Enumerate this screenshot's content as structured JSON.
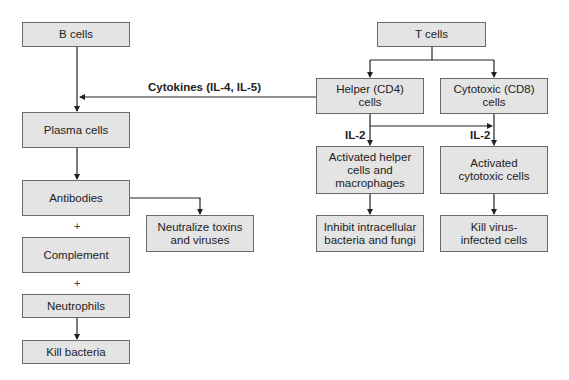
{
  "diagram": {
    "b_branch": {
      "b_cells": "B cells",
      "plasma_cells": "Plasma cells",
      "antibodies": "Antibodies",
      "neutralize": "Neutralize toxins and viruses",
      "plus1": "+",
      "complement": "Complement",
      "plus2": "+",
      "neutrophils": "Neutrophils",
      "kill_bacteria": "Kill bacteria"
    },
    "t_branch": {
      "t_cells": "T cells",
      "helper": "Helper (CD4) cells",
      "cytotoxic": "Cytotoxic (CD8) cells",
      "activated_helper": "Activated helper cells and macrophages",
      "activated_cytotoxic": "Activated cytotoxic cells",
      "inhibit": "Inhibit intracellular bacteria and fungi",
      "kill_virus": "Kill virus-infected cells"
    },
    "edge_labels": {
      "cytokines": "Cytokines (IL-4, IL-5)",
      "il2_left": "IL-2",
      "il2_right": "IL-2"
    },
    "colors": {
      "box_fill": "#e4e4e4",
      "box_border": "#6a6a6a",
      "line": "#222222"
    }
  }
}
